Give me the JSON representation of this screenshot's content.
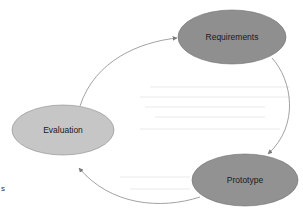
{
  "diagram": {
    "type": "cycle",
    "nodes": [
      {
        "id": "requirements",
        "label": "Requirements",
        "fill": "#8f8f8f"
      },
      {
        "id": "prototype",
        "label": "Prototype",
        "fill": "#929292"
      },
      {
        "id": "evaluation",
        "label": "Evaluation",
        "fill": "#c6c6c6"
      }
    ],
    "edges": [
      {
        "from": "evaluation",
        "to": "requirements"
      },
      {
        "from": "requirements",
        "to": "prototype"
      },
      {
        "from": "prototype",
        "to": "evaluation"
      }
    ],
    "edge_color": "#8a8a8a"
  },
  "margin_text": "s"
}
